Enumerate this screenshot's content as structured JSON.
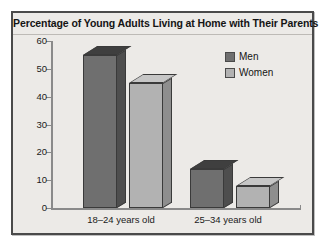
{
  "chart_data": {
    "type": "bar",
    "title": "Percentage of Young Adults Living at Home with Their Parents",
    "categories": [
      "18–24 years old",
      "25–34 years old"
    ],
    "series": [
      {
        "name": "Men",
        "color": "#6f6f6f",
        "values": [
          55,
          14
        ]
      },
      {
        "name": "Women",
        "color": "#b2b2b2",
        "values": [
          45,
          8
        ]
      }
    ],
    "xlabel": "",
    "ylabel": "",
    "ylim": [
      0,
      60
    ],
    "yticks": [
      0,
      10,
      20,
      30,
      40,
      50,
      60
    ],
    "ytick_labels": [
      "0",
      "10",
      "20",
      "30",
      "40",
      "50",
      "60"
    ],
    "grid": false,
    "legend_position": "upper right",
    "style": "3d-bar"
  },
  "legend": {
    "items": [
      {
        "label": "Men"
      },
      {
        "label": "Women"
      }
    ]
  }
}
